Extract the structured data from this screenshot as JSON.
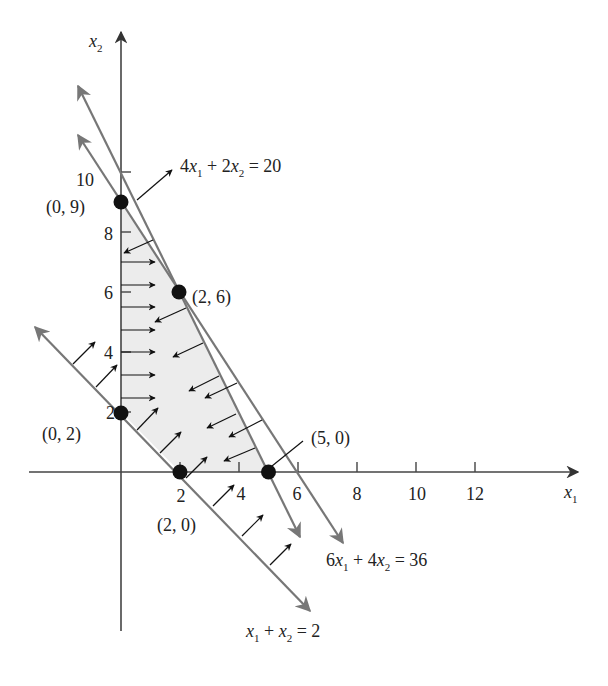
{
  "figure": {
    "type": "linear-programming-feasible-region",
    "axes": {
      "x_label": "x",
      "x_label_sub": "1",
      "y_label": "x",
      "y_label_sub": "2",
      "x_ticks": [
        "2",
        "4",
        "6",
        "8",
        "10",
        "12"
      ],
      "y_ticks": [
        "2",
        "4",
        "6",
        "8",
        "10"
      ]
    },
    "constraints": [
      {
        "id": "c1",
        "lhs_a": "4",
        "lhs_b": "2",
        "rhs": "20",
        "label": "4x1 + 2x2 = 20",
        "direction": "<="
      },
      {
        "id": "c2",
        "lhs_a": "6",
        "lhs_b": "4",
        "rhs": "36",
        "label": "6x1 + 4x2 = 36",
        "direction": "<="
      },
      {
        "id": "c3",
        "lhs_a": "",
        "lhs_b": "",
        "rhs": "2",
        "label": "x1 + x2 = 2",
        "direction": ">="
      }
    ],
    "vertices": [
      {
        "label": "(0, 9)",
        "x1": 0,
        "x2": 9
      },
      {
        "label": "(2, 6)",
        "x1": 2,
        "x2": 6
      },
      {
        "label": "(5, 0)",
        "x1": 5,
        "x2": 0
      },
      {
        "label": "(2, 0)",
        "x1": 2,
        "x2": 0
      },
      {
        "label": "(0, 2)",
        "x1": 0,
        "x2": 2
      }
    ],
    "colors": {
      "region_fill": "#ececec",
      "constraint_line": "#777777",
      "axis": "#444444",
      "arrow": "#111111",
      "vertex": "#111111"
    }
  },
  "labels": {
    "c1_text_a": "4",
    "c1_text_x1": "x",
    "c1_sub1": "1",
    "c1_plus": " + 2",
    "c1_x2": "x",
    "c1_sub2": "2",
    "c1_eq": " = 20",
    "c2_text_a": "6",
    "c2_x1": "x",
    "c2_sub1": "1",
    "c2_plus": " + 4",
    "c2_x2": "x",
    "c2_sub2": "2",
    "c2_eq": " = 36",
    "c3_x1": "x",
    "c3_sub1": "1",
    "c3_plus": " + ",
    "c3_x2": "x",
    "c3_sub2": "2",
    "c3_eq": " = 2",
    "v09": "(0, 9)",
    "v26": "(2, 6)",
    "v50": "(5, 0)",
    "v20": "(2, 0)",
    "v02": "(0, 2)",
    "xt2": "2",
    "xt4": "4",
    "xt6": "6",
    "xt8": "8",
    "xt10": "10",
    "xt12": "12",
    "yt2": "2",
    "yt4": "4",
    "yt6": "6",
    "yt8": "8",
    "yt10": "10"
  }
}
